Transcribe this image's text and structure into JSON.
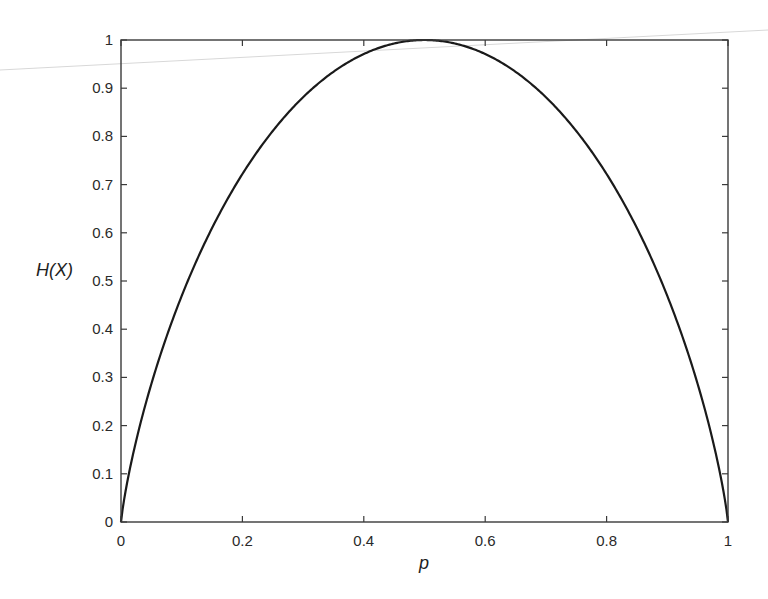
{
  "chart_data": {
    "type": "line",
    "title": "",
    "xlabel": "p",
    "ylabel": "H(X)",
    "xlim": [
      0,
      1
    ],
    "ylim": [
      0,
      1
    ],
    "grid": false,
    "legend": null,
    "xticks": [
      0,
      0.2,
      0.4,
      0.6,
      0.8,
      1
    ],
    "xtick_labels": [
      "0",
      "0.2",
      "0.4",
      "0.6",
      "0.8",
      "1"
    ],
    "yticks": [
      0,
      0.1,
      0.2,
      0.3,
      0.4,
      0.5,
      0.6,
      0.7,
      0.8,
      0.9,
      1
    ],
    "ytick_labels": [
      "0",
      "0.1",
      "0.2",
      "0.3",
      "0.4",
      "0.5",
      "0.6",
      "0.7",
      "0.8",
      "0.9",
      "1"
    ],
    "series": [
      {
        "name": "binary entropy H(p) = -p log2 p - (1-p) log2 (1-p)",
        "color": "#1a1a1a",
        "x": [
          0,
          0.01,
          0.02,
          0.05,
          0.1,
          0.15,
          0.2,
          0.25,
          0.3,
          0.35,
          0.4,
          0.45,
          0.5,
          0.55,
          0.6,
          0.65,
          0.7,
          0.75,
          0.8,
          0.85,
          0.9,
          0.95,
          0.98,
          0.99,
          1
        ],
        "y": [
          0,
          0.081,
          0.141,
          0.286,
          0.469,
          0.61,
          0.722,
          0.811,
          0.881,
          0.934,
          0.971,
          0.993,
          1.0,
          0.993,
          0.971,
          0.934,
          0.881,
          0.811,
          0.722,
          0.61,
          0.469,
          0.286,
          0.141,
          0.081,
          0
        ]
      }
    ]
  }
}
